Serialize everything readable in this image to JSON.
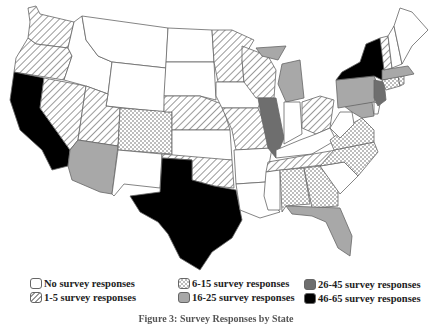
{
  "figure": {
    "caption": "Figure 3: Survey Responses by State"
  },
  "legend": {
    "items": [
      {
        "key": "none",
        "label": "No survey responses",
        "fill": "#ffffff",
        "pattern": "none"
      },
      {
        "key": "r1_5",
        "label": "1-5 survey responses",
        "fill": "#ffffff",
        "pattern": "hatch"
      },
      {
        "key": "r6_15",
        "label": "6-15 survey responses",
        "fill": "#ffffff",
        "pattern": "checker"
      },
      {
        "key": "r16_25",
        "label": "16-25 survey responses",
        "fill": "#a8a8a8",
        "pattern": "none"
      },
      {
        "key": "r26_45",
        "label": "26-45 survey responses",
        "fill": "#6e6e6e",
        "pattern": "none"
      },
      {
        "key": "r46_65",
        "label": "46-65 survey responses",
        "fill": "#000000",
        "pattern": "none"
      }
    ]
  },
  "colors": {
    "border": "#666666",
    "hatch": "#9a9a9a",
    "checker": "#bdbdbd"
  },
  "states": {
    "WA": "r1_5",
    "OR": "r1_5",
    "CA": "r46_65",
    "NV": "r1_5",
    "ID": "none",
    "MT": "none",
    "WY": "none",
    "UT": "r1_5",
    "AZ": "r16_25",
    "CO": "r6_15",
    "NM": "none",
    "ND": "none",
    "SD": "none",
    "NE": "r1_5",
    "KS": "none",
    "OK": "r1_5",
    "TX": "r46_65",
    "MN": "r1_5",
    "IA": "none",
    "MO": "r1_5",
    "AR": "none",
    "LA": "none",
    "WI": "r1_5",
    "IL": "r26_45",
    "MI": "r16_25",
    "IN": "none",
    "OH": "r1_5",
    "KY": "none",
    "TN": "r1_5",
    "MS": "none",
    "AL": "r6_15",
    "GA": "r6_15",
    "FL": "r16_25",
    "SC": "none",
    "NC": "r6_15",
    "VA": "r6_15",
    "WV": "none",
    "MD": "r16_25",
    "DE": "none",
    "PA": "r16_25",
    "NJ": "r26_45",
    "NY": "r46_65",
    "CT": "r6_15",
    "RI": "r6_15",
    "MA": "r16_25",
    "VT": "r1_5",
    "NH": "none",
    "ME": "none"
  }
}
